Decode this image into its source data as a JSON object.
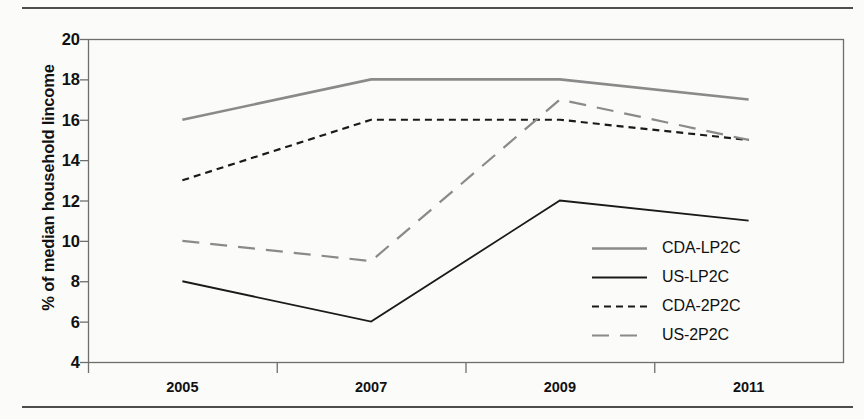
{
  "figure": {
    "background_color": "#fbfbfa",
    "rule_color": "#4d4d4d",
    "axis_color": "#6e6e6e",
    "ylabel": "% of median household lincome"
  },
  "chart_data": {
    "type": "line",
    "title": "",
    "subtitle": "",
    "xlabel": "",
    "ylabel": "% of median household lincome",
    "categories": [
      "2005",
      "2007",
      "2009",
      "2011"
    ],
    "x_tick_labels": [
      "2005",
      "2007",
      "2009",
      "2011"
    ],
    "y_tick_labels": [
      "4",
      "6",
      "8",
      "10",
      "12",
      "14",
      "16",
      "18",
      "20"
    ],
    "y_ticks": [
      4,
      6,
      8,
      10,
      12,
      14,
      16,
      18,
      20
    ],
    "ylim": [
      4,
      20
    ],
    "grid": false,
    "legend_position": "inside-lower-right",
    "series": [
      {
        "name": "CDA-LP2C",
        "values": [
          16,
          18,
          18,
          17
        ],
        "color": "#8a8a8a",
        "style": "solid",
        "width": 2.6
      },
      {
        "name": "US-LP2C",
        "values": [
          8,
          6,
          12,
          11
        ],
        "color": "#1a1a1a",
        "style": "solid",
        "width": 1.8
      },
      {
        "name": "CDA-2P2C",
        "values": [
          13,
          16,
          16,
          15
        ],
        "color": "#1a1a1a",
        "style": "short-dash",
        "width": 2.2
      },
      {
        "name": "US-2P2C",
        "values": [
          10,
          9,
          17,
          15
        ],
        "color": "#8a8a8a",
        "style": "long-dash",
        "width": 2.2
      }
    ]
  },
  "legend": {
    "items": [
      {
        "label": "CDA-LP2C"
      },
      {
        "label": "US-LP2C"
      },
      {
        "label": "CDA-2P2C"
      },
      {
        "label": "US-2P2C"
      }
    ]
  }
}
